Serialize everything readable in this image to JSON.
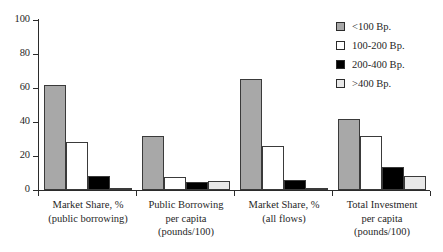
{
  "chart_data": {
    "type": "bar",
    "title": "",
    "subtitle": "",
    "xlabel": "",
    "ylabel": "",
    "ylim": [
      0,
      100
    ],
    "yticks": [
      0,
      20,
      40,
      60,
      80,
      100
    ],
    "ytick_labels": [
      "0",
      "20",
      "40",
      "60",
      "80",
      "100"
    ],
    "grid": false,
    "legend_position": "right",
    "categories": [
      "Market Share, %\n(public borrowing)",
      "Public Borrowing\nper capita\n(pounds/100)",
      "Market Share, %\n(all flows)",
      "Total Investment\nper capita\n(pounds/100)"
    ],
    "series": [
      {
        "name": "<100 Bp.",
        "color": "#a8a8a8",
        "values": [
          61.5,
          32.0,
          65.5,
          42.0
        ]
      },
      {
        "name": "100-200 Bp.",
        "color": "#ffffff",
        "values": [
          28.5,
          7.5,
          26.0,
          31.5
        ]
      },
      {
        "name": "200-400 Bp.",
        "color": "#000000",
        "values": [
          8.5,
          4.8,
          6.0,
          13.8
        ]
      },
      {
        "name": ">400 Bp.",
        "color": "#e8e8e8",
        "values": [
          0.7,
          5.3,
          0.4,
          8.0
        ]
      }
    ]
  },
  "axis": {
    "y_tick_labels": [
      "100",
      "80",
      "60",
      "40",
      "20",
      "0"
    ]
  },
  "legend": {
    "items": [
      {
        "label": "<100 Bp."
      },
      {
        "label": "100-200 Bp."
      },
      {
        "label": "200-400 Bp."
      },
      {
        "label": ">400 Bp."
      }
    ]
  },
  "x_groups": [
    {
      "label": "Market Share, %\n(public borrowing)"
    },
    {
      "label": "Public Borrowing\nper capita\n(pounds/100)"
    },
    {
      "label": "Market Share, %\n(all flows)"
    },
    {
      "label": "Total Investment\nper capita\n(pounds/100)"
    }
  ]
}
